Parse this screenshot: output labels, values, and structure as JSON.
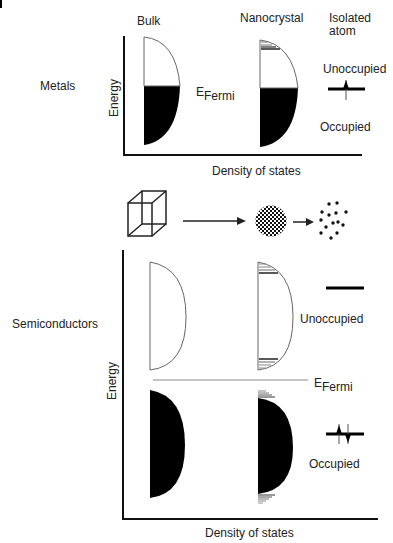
{
  "top_panel": {
    "row_label": "Metals",
    "col_bulk": "Bulk",
    "col_nano": "Nanocrystal",
    "col_atom_line1": "Isolated",
    "col_atom_line2": "atom",
    "y_axis": "Energy",
    "x_axis": "Density of states",
    "fermi_E": "E",
    "fermi_sub": "Fermi",
    "unoccupied": "Unoccupied",
    "occupied": "Occupied"
  },
  "middle": {
    "stages": [
      "bulk-cube",
      "nanocrystal-sphere",
      "isolated-atoms"
    ]
  },
  "bottom_panel": {
    "row_label": "Semiconductors",
    "y_axis": "Energy",
    "x_axis": "Density of states",
    "fermi_E": "E",
    "fermi_sub": "Fermi",
    "unoccupied": "Unoccupied",
    "occupied": "Occupied"
  },
  "colors": {
    "fill": "#000000",
    "outline": "#555555",
    "background": "#ffffff"
  }
}
